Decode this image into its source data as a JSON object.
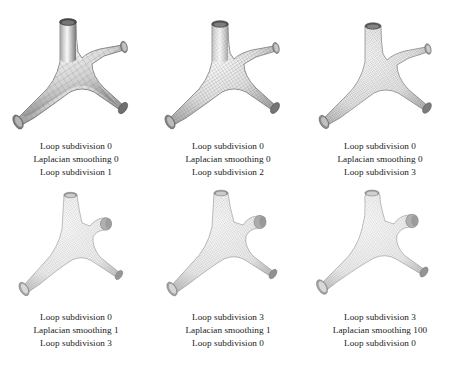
{
  "figure": {
    "background_color": "#ffffff",
    "text_color": "#1a1a1a",
    "rows": 2,
    "columns": 3,
    "panel_count": 6
  },
  "panels": [
    {
      "id": "panel-1",
      "position": "top-left",
      "caption": {
        "line1": "Loop subdivision 0",
        "line2": "Laplacian smoothing 0",
        "line3": "Loop subdivision 1"
      },
      "render": {
        "object": "branching-tube-mesh",
        "branches": 4,
        "mesh_density": "coarse",
        "wire_spacing": 7.5,
        "thickness": 1.0,
        "stub_length": 1.0,
        "shading": "smooth-gray"
      }
    },
    {
      "id": "panel-2",
      "position": "top-center",
      "caption": {
        "line1": "Loop subdivision 0",
        "line2": "Laplacian smoothing 0",
        "line3": "Loop subdivision 2"
      },
      "render": {
        "object": "branching-tube-mesh",
        "branches": 4,
        "mesh_density": "medium",
        "wire_spacing": 4.2,
        "thickness": 0.97,
        "stub_length": 0.95,
        "shading": "smooth-gray"
      }
    },
    {
      "id": "panel-3",
      "position": "top-right",
      "caption": {
        "line1": "Loop subdivision 0",
        "line2": "Laplacian smoothing 0",
        "line3": "Loop subdivision 3"
      },
      "render": {
        "object": "branching-tube-mesh",
        "branches": 4,
        "mesh_density": "fine",
        "wire_spacing": 2.6,
        "thickness": 0.94,
        "stub_length": 0.9,
        "shading": "smooth-gray"
      }
    },
    {
      "id": "panel-4",
      "position": "bottom-left",
      "caption": {
        "line1": "Loop subdivision 0",
        "line2": "Laplacian smoothing 1",
        "line3": "Loop subdivision 3"
      },
      "render": {
        "object": "branching-tube-mesh",
        "branches": 4,
        "mesh_density": "fine",
        "wire_spacing": 2.6,
        "thickness": 0.72,
        "stub_length": 0.34,
        "shading": "smooth-light-gray"
      }
    },
    {
      "id": "panel-5",
      "position": "bottom-center",
      "caption": {
        "line1": "Loop subdivision 3",
        "line2": "Laplacian smoothing 1",
        "line3": "Loop subdivision 0"
      },
      "render": {
        "object": "branching-tube-mesh",
        "branches": 4,
        "mesh_density": "fine",
        "wire_spacing": 2.8,
        "thickness": 0.76,
        "stub_length": 0.38,
        "shading": "smooth-light-gray"
      }
    },
    {
      "id": "panel-6",
      "position": "bottom-right",
      "caption": {
        "line1": "Loop subdivision 3",
        "line2": "Laplacian smoothing 100",
        "line3": "Loop subdivision 0"
      },
      "render": {
        "object": "branching-tube-mesh",
        "branches": 4,
        "mesh_density": "fine",
        "wire_spacing": 2.8,
        "thickness": 0.6,
        "stub_length": 0.4,
        "shading": "smooth-light-gray"
      }
    }
  ]
}
